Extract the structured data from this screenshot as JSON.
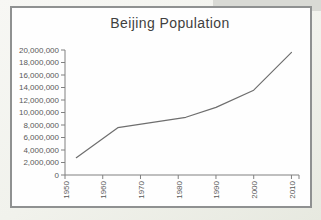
{
  "chart_data": {
    "type": "line",
    "title": "Beijing Population",
    "x": [
      1953,
      1964,
      1982,
      1990,
      2000,
      2010
    ],
    "values": [
      2770000,
      7570000,
      9230000,
      10820000,
      13570000,
      19610000
    ],
    "xlabel": "",
    "ylabel": "",
    "xlim": [
      1950,
      2012
    ],
    "ylim": [
      0,
      20000000
    ],
    "x_ticks": [
      1950,
      1960,
      1970,
      1980,
      1990,
      2000,
      2010
    ],
    "x_tick_labels": [
      "1950",
      "1960",
      "1970",
      "1980",
      "1990",
      "2000",
      "2010"
    ],
    "y_ticks": [
      0,
      2000000,
      4000000,
      6000000,
      8000000,
      10000000,
      12000000,
      14000000,
      16000000,
      18000000,
      20000000
    ],
    "y_tick_labels": [
      "0",
      "2,000,000",
      "4,000,000",
      "6,000,000",
      "8,000,000",
      "10,000,000",
      "12,000,000",
      "14,000,000",
      "16,000,000",
      "18,000,000",
      "20,000,000"
    ],
    "x_tick_label_rotation_deg": -90,
    "grid": false,
    "legend": false,
    "colors": {
      "line": "#6e6e6e",
      "axis": "#808080",
      "tick_label": "#595959",
      "title": "#3f3f3f",
      "frame_border": "#8f9191",
      "frame_background": "#fefefe",
      "page_background": "#f1f2ec"
    }
  }
}
